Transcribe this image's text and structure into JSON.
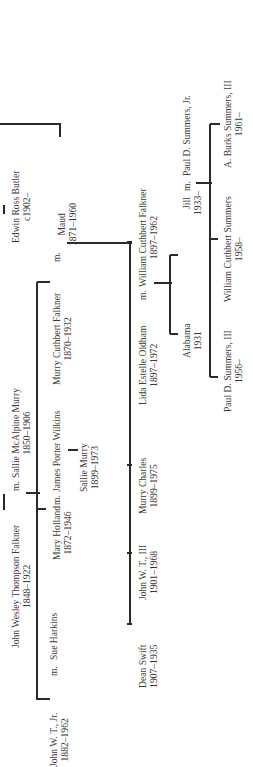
{
  "marriage_marker": "m.",
  "people": {
    "edwin": {
      "name": "Edwin Ross Butler",
      "dates": "c1902–"
    },
    "jwt": {
      "name": "John Wesley Thompson Falkner",
      "dates": "1848–1922"
    },
    "sallie_mcalpine": {
      "name": "Sallie McAlpine Murry",
      "dates": "1850–1906"
    },
    "jwt_jr": {
      "name": "John W. T., Jr.",
      "dates": "1882–1962"
    },
    "sue": {
      "name": "Sue Harkins",
      "dates": ""
    },
    "mary_holland": {
      "name": "Mary Holland",
      "dates": "1872–1946"
    },
    "james_porter": {
      "name": "James Porter Wilkins",
      "dates": ""
    },
    "sallie_murry": {
      "name": "Sallie Murry",
      "dates": "1899–1973"
    },
    "murry_cuthbert": {
      "name": "Murry Cuthbert Falkner",
      "dates": "1870–1932"
    },
    "maud": {
      "name": "Maud",
      "dates": "1871–1960"
    },
    "dean": {
      "name": "Dean Swift",
      "dates": "1907–1935"
    },
    "jwt_iii": {
      "name": "John W. T., III",
      "dates": "1901–1968"
    },
    "murry_charles": {
      "name": "Murry Charles",
      "dates": "1899–1975"
    },
    "lida": {
      "name": "Lida Estelle Oldham",
      "dates": "1897–1972"
    },
    "william": {
      "name": "William Cuthbert Falkner",
      "dates": "1897–1962"
    },
    "alabama": {
      "name": "Alabama",
      "dates": "1931"
    },
    "jill": {
      "name": "Jill",
      "dates": "1933–"
    },
    "paul_jr": {
      "name": "Paul D. Summers, Jr.",
      "dates": ""
    },
    "paul_iii": {
      "name": "Paul D. Summers, III",
      "dates": "1956–"
    },
    "wcs": {
      "name": "William Cuthbert Summers",
      "dates": "1958–"
    },
    "burks": {
      "name": "A. Burks Summers, III",
      "dates": "1961–"
    }
  }
}
